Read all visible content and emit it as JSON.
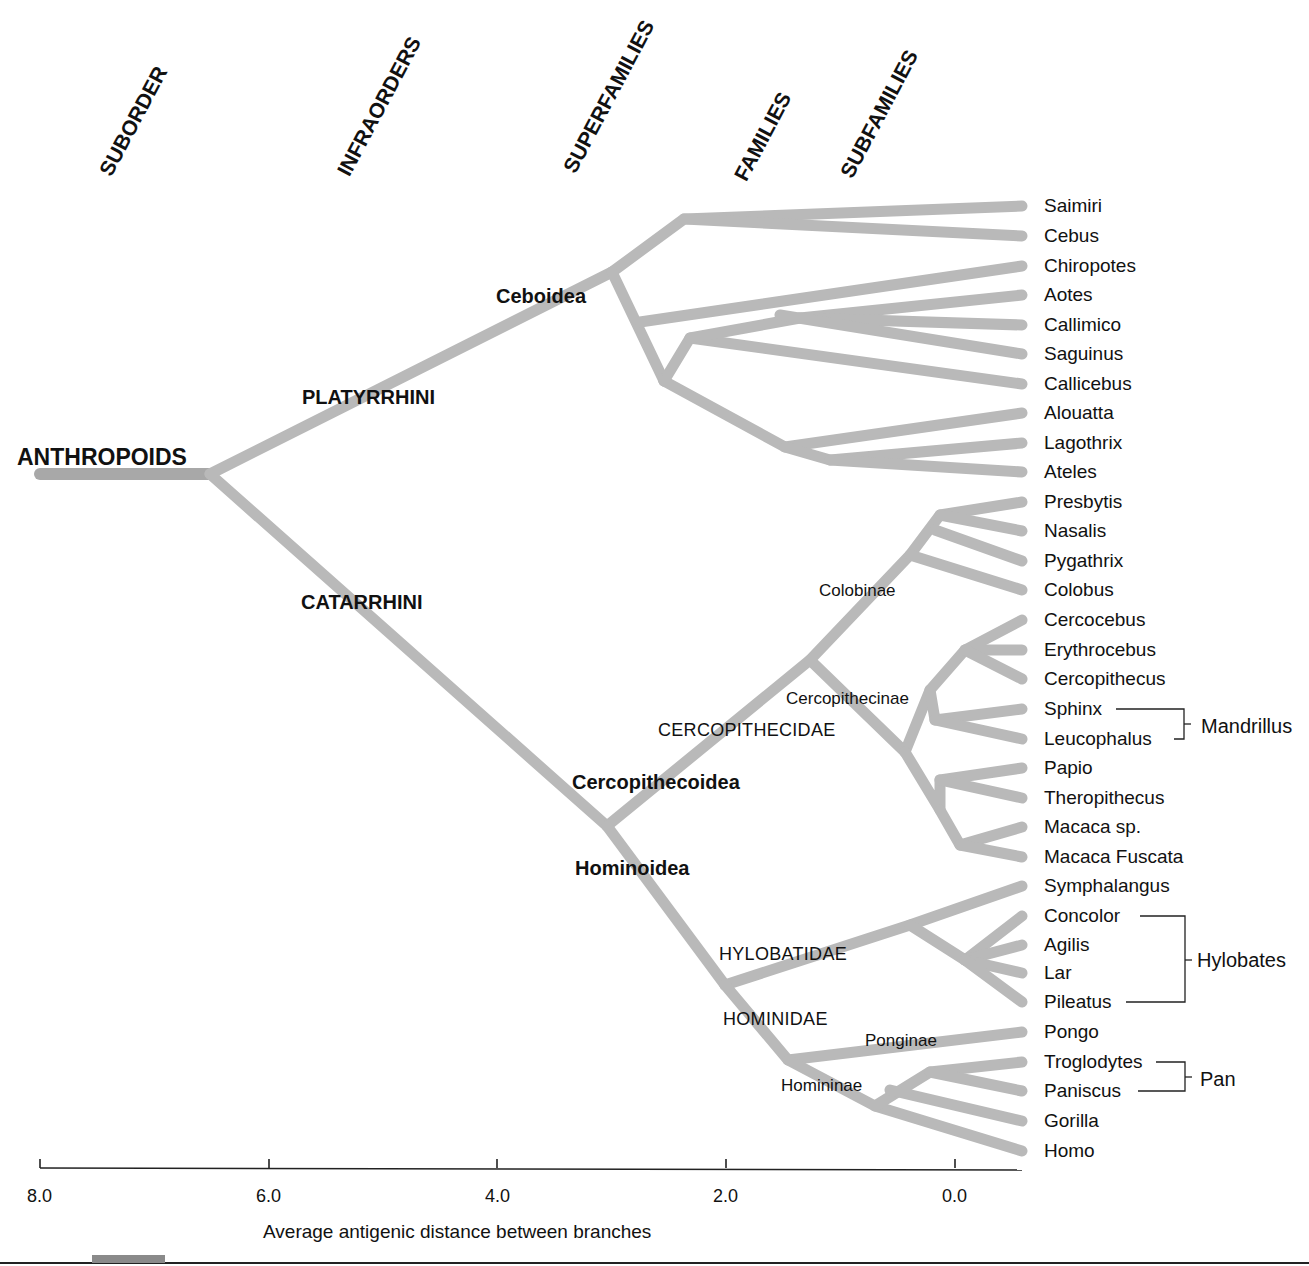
{
  "chart_data": {
    "type": "dendrogram",
    "title": "",
    "xlabel": "Average antigenic distance between branches",
    "x_ticks": [
      "8.0",
      "6.0",
      "4.0",
      "2.0",
      "0.0"
    ],
    "x_range": [
      8.0,
      0.0
    ],
    "rank_headers": [
      "SUBORDER",
      "INFRAORDERS",
      "SUPERFAMILIES",
      "FAMILIES",
      "SUBFAMILIES"
    ],
    "root": "ANTHROPOIDS",
    "infraorders": [
      "PLATYRRHINI",
      "CATARRHINI"
    ],
    "superfamilies": [
      "Ceboidea",
      "Cercopithecoidea",
      "Hominoidea"
    ],
    "families": [
      "CERCOPITHECIDAE",
      "HYLOBATIDAE",
      "HOMINIDAE"
    ],
    "subfamilies": [
      "Colobinae",
      "Cercopithecinae",
      "Ponginae",
      "Homininae"
    ],
    "leaves": [
      "Saimiri",
      "Cebus",
      "Chiropotes",
      "Aotes",
      "Callimico",
      "Saguinus",
      "Callicebus",
      "Alouatta",
      "Lagothrix",
      "Ateles",
      "Presbytis",
      "Nasalis",
      "Pygathrix",
      "Colobus",
      "Cercocebus",
      "Erythrocebus",
      "Cercopithecus",
      "Sphinx",
      "Leucophalus",
      "Papio",
      "Theropithecus",
      "Macaca sp.",
      "Macaca Fuscata",
      "Symphalangus",
      "Concolor",
      "Agilis",
      "Lar",
      "Pileatus",
      "Pongo",
      "Troglodytes",
      "Paniscus",
      "Gorilla",
      "Homo"
    ],
    "genus_brackets": [
      {
        "name": "Mandrillus",
        "members": [
          "Sphinx",
          "Leucophalus"
        ]
      },
      {
        "name": "Hylobates",
        "members": [
          "Concolor",
          "Agilis",
          "Lar",
          "Pileatus"
        ]
      },
      {
        "name": "Pan",
        "members": [
          "Troglodytes",
          "Paniscus"
        ]
      }
    ],
    "approx_node_distances": {
      "ANTHROPOIDS": 6.5,
      "PLATYRRHINI_Ceboidea": 3.0,
      "CATARRHINI_split": 3.0,
      "Cercopithecidae_split": 1.3,
      "Hylobatidae_split": 0.4,
      "Hominidae_Ponginae_split": 1.45,
      "Homininae_split": 0.7
    }
  },
  "headers": {
    "suborder": "SUBORDER",
    "infraorders": "INFRAORDERS",
    "superfamilies": "SUPERFAMILIES",
    "families": "FAMILIES",
    "subfamilies": "SUBFAMILIES"
  },
  "taxa": {
    "anthropoids": "ANTHROPOIDS",
    "platyrrhini": "PLATYRRHINI",
    "catarrhini": "CATARRHINI",
    "ceboidea": "Ceboidea",
    "cercopithecoidea": "Cercopithecoidea",
    "hominoidea": "Hominoidea",
    "cercopithecidae": "CERCOPITHECIDAE",
    "hylobatidae": "HYLOBATIDAE",
    "hominidae": "HOMINIDAE",
    "colobinae": "Colobinae",
    "cercopithecinae": "Cercopithecinae",
    "ponginae": "Ponginae",
    "homininae": "Homininae"
  },
  "leaves": [
    "Saimiri",
    "Cebus",
    "Chiropotes",
    "Aotes",
    "Callimico",
    "Saguinus",
    "Callicebus",
    "Alouatta",
    "Lagothrix",
    "Ateles",
    "Presbytis",
    "Nasalis",
    "Pygathrix",
    "Colobus",
    "Cercocebus",
    "Erythrocebus",
    "Cercopithecus",
    "Sphinx",
    "Leucophalus",
    "Papio",
    "Theropithecus",
    "Macaca sp.",
    "Macaca Fuscata",
    "Symphalangus",
    "Concolor",
    "Agilis",
    "Lar",
    "Pileatus",
    "Pongo",
    "Troglodytes",
    "Paniscus",
    "Gorilla",
    "Homo"
  ],
  "groups": {
    "mandrillus": "Mandrillus",
    "hylobates": "Hylobates",
    "pan": "Pan"
  },
  "axis": {
    "ticks": [
      "8.0",
      "6.0",
      "4.0",
      "2.0",
      "0.0"
    ],
    "title": "Average antigenic distance between branches"
  },
  "colors": {
    "branch": "#b9b9b9",
    "root_branch": "#a8a8a8",
    "text": "#111111",
    "axis": "#222222"
  }
}
